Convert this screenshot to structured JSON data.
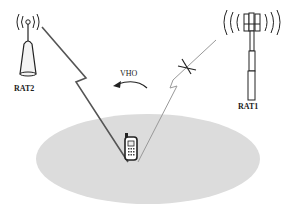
{
  "diagram": {
    "title": "",
    "nodes": [
      {
        "id": "rat2",
        "label": "RAT2",
        "type": "wireless-access-point"
      },
      {
        "id": "rat1",
        "label": "RAT1",
        "type": "cellular-tower"
      },
      {
        "id": "mobile",
        "label": "",
        "type": "mobile-phone"
      }
    ],
    "links": [
      {
        "from": "rat2",
        "to": "mobile",
        "style": "lightning",
        "status": "active"
      },
      {
        "from": "rat1",
        "to": "mobile",
        "style": "lightning",
        "status": "broken"
      }
    ],
    "handover": {
      "label": "VHO",
      "direction": "rat1-to-rat2"
    },
    "coverage_area": {
      "color": "#d9d9d9"
    }
  }
}
